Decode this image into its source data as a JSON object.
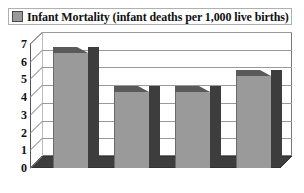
{
  "legend": {
    "swatch_name": "legend-color-swatch",
    "swatch_color": "#9a9a9a",
    "label": "Infant Mortality (infant deaths per 1,000 live births)"
  },
  "chart_data": {
    "type": "bar",
    "title": "Infant Mortality (infant deaths per 1,000 live births)",
    "categories": [
      "US",
      "Germany",
      "France",
      "Canada"
    ],
    "values": [
      6.5,
      4.3,
      4.3,
      5.2
    ],
    "series": [
      {
        "name": "Infant Mortality (infant deaths per 1,000 live births)",
        "values": [
          6.5,
          4.3,
          4.3,
          5.2
        ],
        "color": "#9a9a9a"
      }
    ],
    "xlabel": "",
    "ylabel": "",
    "ylim": [
      0,
      7
    ],
    "yticks": [
      0,
      1,
      2,
      3,
      4,
      5,
      6,
      7
    ],
    "ytick_labels": [
      "0",
      "1",
      "2",
      "3",
      "4",
      "5",
      "6",
      "7"
    ],
    "grid": true,
    "grid_axis": "y",
    "legend_position": "top",
    "style": "3d-column",
    "colors": {
      "bar_front": "#9a9a9a",
      "bar_side": "#3d3d3d",
      "bar_top": "#5a5a5a",
      "gridline": "#9a9a9a",
      "axis": "#555555",
      "background": "#ffffff",
      "text": "#111111"
    }
  }
}
